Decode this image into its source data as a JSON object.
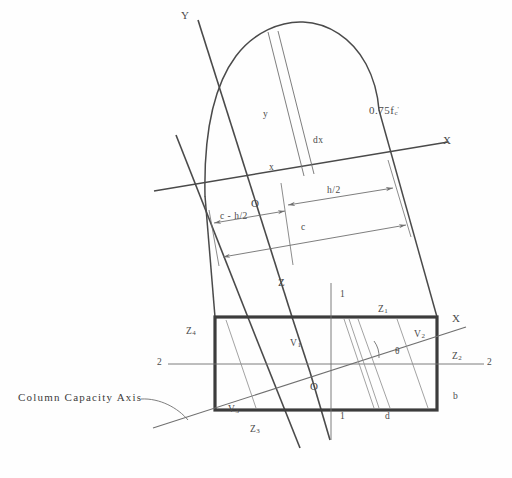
{
  "figure": {
    "caption": "Column Capacity Axis",
    "colors": {
      "line": "#4a4a4a",
      "thin_line": "#6f6f6f",
      "section_outline": "#3c3c3c",
      "background": "#fefefe",
      "text": "#4a4a4a"
    }
  },
  "axes": {
    "y_upper": "Y",
    "x_upper": "X",
    "x_lower": "X",
    "origin_upper": "O",
    "origin_lower": "O",
    "section_left": "2",
    "section_right": "2",
    "section_top": "1",
    "section_bottom": "1"
  },
  "stress_block": {
    "stress_label": "0.75f",
    "stress_sub": "c",
    "stress_prime": "'",
    "ordinate_y": "y",
    "abscissa_x": "x",
    "strip_width": "dx",
    "resultant": "Z"
  },
  "dimensions": [
    {
      "name": "half-depth",
      "label": "h/2"
    },
    {
      "name": "neutral-axis-offset",
      "label": "c - h/2"
    },
    {
      "name": "neutral-axis-depth",
      "label": "c"
    }
  ],
  "section": {
    "width_label": "b",
    "depth_label": "d",
    "angle_label": "θ",
    "volumes": [
      {
        "name": "volume-1",
        "label": "V",
        "sub": "1"
      },
      {
        "name": "volume-2",
        "label": "V",
        "sub": "2"
      },
      {
        "name": "volume-3",
        "label": "V",
        "sub": "3"
      }
    ],
    "zones": [
      {
        "name": "zone-1",
        "label": "Z",
        "sub": "1"
      },
      {
        "name": "zone-2",
        "label": "Z",
        "sub": "2"
      },
      {
        "name": "zone-3",
        "label": "Z",
        "sub": "3"
      },
      {
        "name": "zone-4",
        "label": "Z",
        "sub": "4"
      }
    ]
  }
}
